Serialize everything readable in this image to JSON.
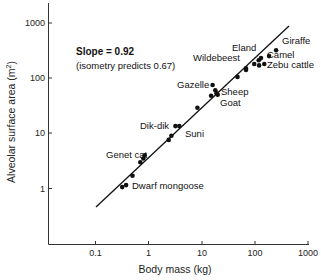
{
  "chart_data": {
    "type": "scatter",
    "title": "",
    "xlabel": "Body mass (kg)",
    "ylabel": "Alveolar surface area (m²)",
    "ylabel_main": "Alveolar surface area (m",
    "ylabel_sup": "2",
    "ylabel_tail": ")",
    "xscale": "log",
    "yscale": "log",
    "xlim": [
      0.015,
      1100
    ],
    "ylim": [
      0.05,
      2500
    ],
    "x_ticks": [
      0.1,
      1,
      10,
      100,
      1000
    ],
    "x_tick_labels": [
      "0.1",
      "1",
      "10",
      "100",
      "1000"
    ],
    "y_ticks": [
      1,
      10,
      100,
      1000
    ],
    "y_tick_labels": [
      "1",
      "10",
      "100",
      "1000"
    ],
    "grid": false,
    "legend": null,
    "annotations": [
      {
        "text": "Slope = 0.92",
        "bold": true
      },
      {
        "text": "(isometry predicts 0.67)",
        "bold": false
      }
    ],
    "fit_line": {
      "slope": 0.92,
      "x_range": [
        0.1,
        800
      ],
      "y_range": [
        0.45,
        900
      ]
    },
    "points": [
      {
        "x": 0.32,
        "y": 1.06
      },
      {
        "x": 0.38,
        "y": 1.15
      },
      {
        "x": 0.5,
        "y": 1.7
      },
      {
        "x": 0.7,
        "y": 3.0
      },
      {
        "x": 0.8,
        "y": 3.5
      },
      {
        "x": 0.85,
        "y": 4.0
      },
      {
        "x": 2.4,
        "y": 7.6
      },
      {
        "x": 2.7,
        "y": 9.0
      },
      {
        "x": 3.2,
        "y": 13.5
      },
      {
        "x": 3.8,
        "y": 13.5
      },
      {
        "x": 8.3,
        "y": 29
      },
      {
        "x": 16,
        "y": 75
      },
      {
        "x": 18,
        "y": 60
      },
      {
        "x": 15,
        "y": 48
      },
      {
        "x": 19,
        "y": 53
      },
      {
        "x": 20,
        "y": 50
      },
      {
        "x": 47,
        "y": 105
      },
      {
        "x": 68,
        "y": 140
      },
      {
        "x": 97,
        "y": 180
      },
      {
        "x": 68,
        "y": 150
      },
      {
        "x": 120,
        "y": 170
      },
      {
        "x": 130,
        "y": 230
      },
      {
        "x": 150,
        "y": 180
      },
      {
        "x": 118,
        "y": 210
      },
      {
        "x": 185,
        "y": 250
      },
      {
        "x": 250,
        "y": 320
      }
    ],
    "point_labels": [
      {
        "text": "Giraffe"
      },
      {
        "text": "Eland"
      },
      {
        "text": "Wildebeest"
      },
      {
        "text": "Camel"
      },
      {
        "text": "Zebu cattle"
      },
      {
        "text": "Gazelle"
      },
      {
        "text": "Sheep"
      },
      {
        "text": "Goat"
      },
      {
        "text": "Dik-dik"
      },
      {
        "text": "Suni"
      },
      {
        "text": "Genet cat"
      },
      {
        "text": "Dwarf mongoose"
      }
    ]
  }
}
